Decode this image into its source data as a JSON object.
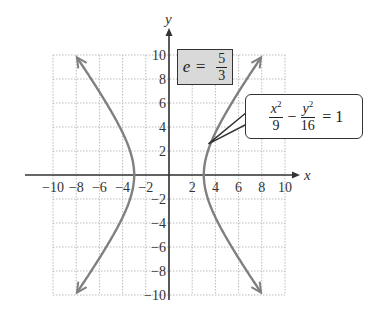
{
  "chart_data": {
    "type": "line",
    "title": "",
    "xlabel": "x",
    "ylabel": "y",
    "xlim": [
      -10,
      10
    ],
    "ylim": [
      -10,
      10
    ],
    "grid": true,
    "x_ticks": [
      -10,
      -8,
      -6,
      -4,
      -2,
      2,
      4,
      6,
      8,
      10
    ],
    "y_ticks": [
      -10,
      -8,
      -6,
      -4,
      -2,
      2,
      4,
      6,
      8,
      10
    ],
    "x_tick_labels": [
      "−10",
      "−8",
      "−6",
      "−4",
      "−2",
      "2",
      "4",
      "6",
      "8",
      "10"
    ],
    "y_tick_labels": [
      "−10",
      "−8",
      "−6",
      "−4",
      "−2",
      "2",
      "4",
      "6",
      "8",
      "10"
    ],
    "series": [
      {
        "name": "hyperbola right branch",
        "equation": "x^2/9 - y^2/16 = 1",
        "x": [
          7.95,
          6.76,
          5.61,
          4.54,
          3.61,
          3.0,
          3.61,
          4.54,
          5.61,
          6.76,
          7.95
        ],
        "y": [
          -9.83,
          -8,
          -6.33,
          -4.54,
          -2.68,
          0,
          2.68,
          4.54,
          6.33,
          8,
          9.83
        ]
      },
      {
        "name": "hyperbola left branch",
        "equation": "x^2/9 - y^2/16 = 1",
        "x": [
          -7.95,
          -6.76,
          -5.61,
          -4.54,
          -3.61,
          -3.0,
          -3.61,
          -4.54,
          -5.61,
          -6.76,
          -7.95
        ],
        "y": [
          -9.83,
          -8,
          -6.33,
          -4.54,
          -2.68,
          0,
          2.68,
          4.54,
          6.33,
          8,
          9.83
        ]
      }
    ],
    "annotations": [
      {
        "text": "e = 5/3",
        "boxed": true,
        "fill": "#d9d9d9"
      },
      {
        "text": "x^2/9 − y^2/16 = 1",
        "callout": true,
        "points_to": [
          3.4,
          2.2
        ]
      }
    ],
    "colors": {
      "curve": "#808080",
      "axes": "#333333",
      "grid": "#bbbbbb"
    }
  },
  "labels": {
    "x_axis": "x",
    "y_axis": "y",
    "ecc_var": "e =",
    "ecc_num": "5",
    "ecc_den": "3",
    "eq_x": "x",
    "eq_y": "y",
    "eq_exp": "2",
    "eq_den1": "9",
    "eq_minus": "−",
    "eq_den2": "16",
    "eq_rhs": "= 1"
  }
}
